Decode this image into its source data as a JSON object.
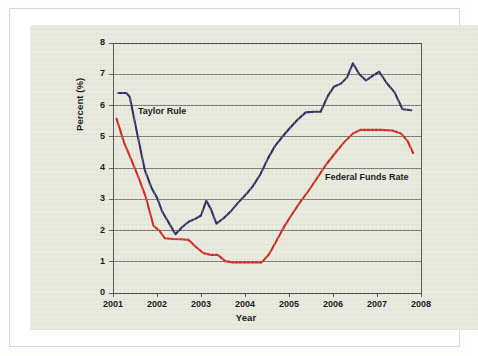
{
  "figure": {
    "panel_background": "#e7e9dc",
    "page_background": "#ffffff"
  },
  "chart_data": {
    "type": "line",
    "title": "",
    "subtitle": "",
    "xlabel": "Year",
    "ylabel": "Percent (%)",
    "xlim": [
      2001,
      2008
    ],
    "ylim": [
      0,
      8
    ],
    "grid": "horizontal",
    "legend_position": "inline-annotations",
    "x_tick_labels": [
      "2001",
      "2002",
      "2003",
      "2004",
      "2005",
      "2006",
      "2007",
      "2008"
    ],
    "y_tick_labels": [
      "0",
      "1",
      "2",
      "3",
      "4",
      "5",
      "6",
      "7",
      "8"
    ],
    "x_ticks": [
      2001,
      2002,
      2003,
      2004,
      2005,
      2006,
      2007,
      2008
    ],
    "y_ticks": [
      0,
      1,
      2,
      3,
      4,
      5,
      6,
      7,
      8
    ],
    "series": [
      {
        "name": "Taylor Rule",
        "color": "#2f2f63",
        "label_text": "Taylor Rule",
        "points": [
          [
            2001.12,
            6.4
          ],
          [
            2001.3,
            6.4
          ],
          [
            2001.38,
            6.28
          ],
          [
            2001.55,
            5.1
          ],
          [
            2001.72,
            3.95
          ],
          [
            2001.88,
            3.35
          ],
          [
            2002.0,
            3.05
          ],
          [
            2002.12,
            2.6
          ],
          [
            2002.28,
            2.22
          ],
          [
            2002.42,
            1.88
          ],
          [
            2002.58,
            2.12
          ],
          [
            2002.72,
            2.28
          ],
          [
            2002.88,
            2.38
          ],
          [
            2003.0,
            2.48
          ],
          [
            2003.12,
            2.95
          ],
          [
            2003.22,
            2.7
          ],
          [
            2003.35,
            2.22
          ],
          [
            2003.52,
            2.4
          ],
          [
            2003.68,
            2.62
          ],
          [
            2003.85,
            2.9
          ],
          [
            2004.02,
            3.15
          ],
          [
            2004.18,
            3.42
          ],
          [
            2004.35,
            3.8
          ],
          [
            2004.52,
            4.3
          ],
          [
            2004.68,
            4.7
          ],
          [
            2004.85,
            5.0
          ],
          [
            2005.02,
            5.28
          ],
          [
            2005.2,
            5.55
          ],
          [
            2005.38,
            5.78
          ],
          [
            2005.58,
            5.8
          ],
          [
            2005.72,
            5.8
          ],
          [
            2005.88,
            6.3
          ],
          [
            2006.02,
            6.6
          ],
          [
            2006.18,
            6.7
          ],
          [
            2006.32,
            6.9
          ],
          [
            2006.45,
            7.35
          ],
          [
            2006.6,
            7.0
          ],
          [
            2006.75,
            6.8
          ],
          [
            2006.9,
            6.95
          ],
          [
            2007.05,
            7.08
          ],
          [
            2007.22,
            6.72
          ],
          [
            2007.4,
            6.42
          ],
          [
            2007.58,
            5.88
          ],
          [
            2007.78,
            5.85
          ]
        ]
      },
      {
        "name": "Federal Funds Rate",
        "color": "#cf2a22",
        "label_text": "Federal Funds Rate",
        "points": [
          [
            2001.08,
            5.58
          ],
          [
            2001.25,
            4.82
          ],
          [
            2001.42,
            4.25
          ],
          [
            2001.58,
            3.7
          ],
          [
            2001.75,
            3.05
          ],
          [
            2001.92,
            2.15
          ],
          [
            2002.05,
            2.0
          ],
          [
            2002.18,
            1.75
          ],
          [
            2002.35,
            1.73
          ],
          [
            2002.55,
            1.72
          ],
          [
            2002.72,
            1.7
          ],
          [
            2002.88,
            1.48
          ],
          [
            2003.05,
            1.28
          ],
          [
            2003.22,
            1.22
          ],
          [
            2003.38,
            1.22
          ],
          [
            2003.55,
            1.02
          ],
          [
            2003.72,
            0.98
          ],
          [
            2004.05,
            0.98
          ],
          [
            2004.38,
            0.98
          ],
          [
            2004.55,
            1.25
          ],
          [
            2004.72,
            1.68
          ],
          [
            2004.88,
            2.1
          ],
          [
            2005.05,
            2.48
          ],
          [
            2005.25,
            2.9
          ],
          [
            2005.45,
            3.28
          ],
          [
            2005.65,
            3.7
          ],
          [
            2005.85,
            4.12
          ],
          [
            2006.05,
            4.48
          ],
          [
            2006.25,
            4.82
          ],
          [
            2006.45,
            5.1
          ],
          [
            2006.62,
            5.22
          ],
          [
            2006.85,
            5.22
          ],
          [
            2007.1,
            5.22
          ],
          [
            2007.35,
            5.2
          ],
          [
            2007.55,
            5.1
          ],
          [
            2007.7,
            4.85
          ],
          [
            2007.82,
            4.48
          ]
        ]
      }
    ]
  }
}
